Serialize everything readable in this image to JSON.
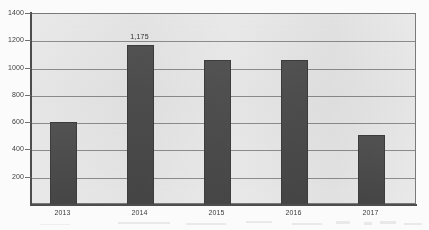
{
  "chart_data": {
    "type": "bar",
    "title": "",
    "xlabel": "",
    "ylabel": "",
    "categories": [
      "2013",
      "2014",
      "2015",
      "2016",
      "2017"
    ],
    "values": [
      612,
      1175,
      1063,
      1060,
      510
    ],
    "data_labels": [
      "",
      "1,175",
      "",
      "",
      ""
    ],
    "ylim": [
      0,
      1400
    ],
    "ytick_labels": [
      "1400",
      "1200",
      "1000",
      "800",
      "600",
      "400",
      "200"
    ],
    "ytick_values": [
      1400,
      1200,
      1000,
      800,
      600,
      400,
      200
    ],
    "grid": true,
    "legend": false,
    "bar_color": "#4a4a4a",
    "plot_background": "#e9e9e9",
    "gridline_color": "#8d8d8d",
    "axis_color": "#4d4d4d"
  }
}
